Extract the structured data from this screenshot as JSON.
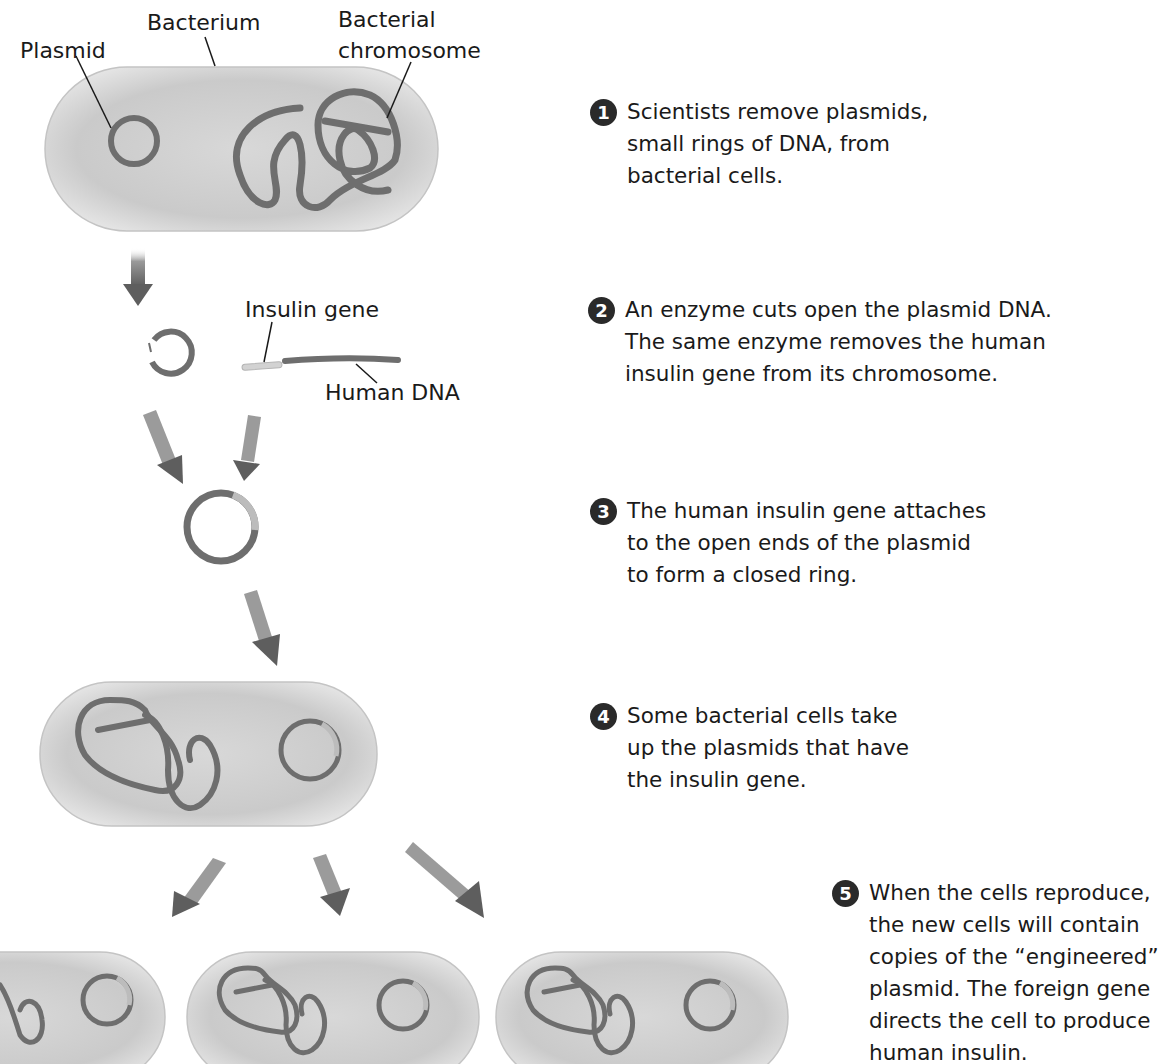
{
  "diagram": {
    "colors": {
      "cell_fill": "#d0d0d0",
      "cell_edge": "#bdbdbd",
      "dna": "#6e6e6e",
      "insulin_gene": "#cfcfcf",
      "arrow": "#6a6a6a",
      "badge": "#2a2a2a",
      "text": "#1a1a1a"
    },
    "labels": {
      "plasmid": "Plasmid",
      "bacterium": "Bacterium",
      "bacterial_chromosome_line1": "Bacterial",
      "bacterial_chromosome_line2": "chromosome",
      "insulin_gene": "Insulin gene",
      "human_dna": "Human DNA"
    },
    "steps": [
      {
        "number": "1",
        "lines": [
          "Scientists remove plasmids,",
          "small rings of DNA, from",
          "bacterial cells."
        ]
      },
      {
        "number": "2",
        "lines": [
          "An enzyme cuts open the plasmid DNA.",
          "The same enzyme removes the human",
          "insulin gene from its chromosome."
        ]
      },
      {
        "number": "3",
        "lines": [
          "The human insulin gene attaches",
          "to the open ends of the plasmid",
          "to form a closed ring."
        ]
      },
      {
        "number": "4",
        "lines": [
          "Some bacterial cells take",
          "up the plasmids that have",
          "the insulin gene."
        ]
      },
      {
        "number": "5",
        "lines": [
          "When the cells reproduce,",
          "the new cells will contain",
          "copies of the “engineered”",
          "plasmid. The foreign gene",
          "directs the cell to produce",
          "human insulin."
        ]
      }
    ]
  }
}
